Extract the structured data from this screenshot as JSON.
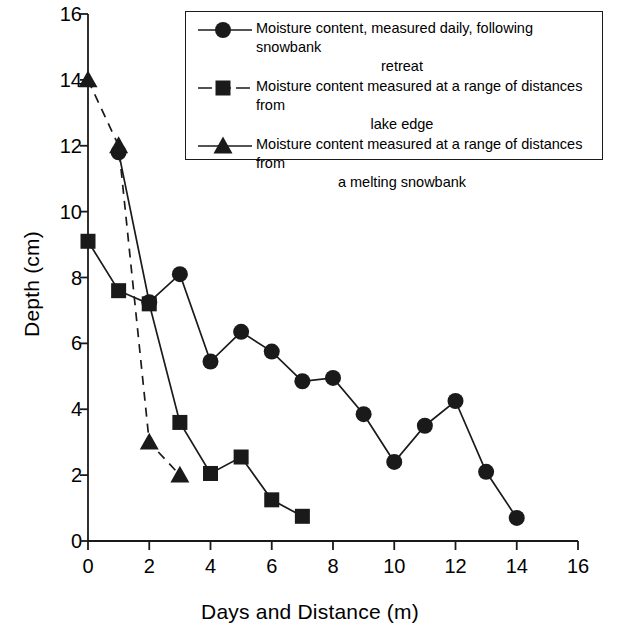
{
  "chart_data": {
    "type": "line",
    "title": "",
    "xlabel": "Days and Distance (m)",
    "ylabel": "Depth (cm)",
    "xlim": [
      0,
      16
    ],
    "ylim": [
      0,
      16
    ],
    "xticks": [
      0,
      2,
      4,
      6,
      8,
      10,
      12,
      14,
      16
    ],
    "yticks": [
      0,
      2,
      4,
      6,
      8,
      10,
      12,
      14,
      16
    ],
    "grid": false,
    "legend_position": "top-right",
    "series": [
      {
        "name": "Moisture content, measured daily, following snowbank retreat",
        "marker": "circle",
        "linestyle": "solid",
        "x": [
          1,
          2,
          3,
          4,
          5,
          6,
          7,
          8,
          9,
          10,
          11,
          12,
          13,
          14
        ],
        "y": [
          11.8,
          7.25,
          8.1,
          5.45,
          6.35,
          5.75,
          4.85,
          4.95,
          3.85,
          2.4,
          3.5,
          4.25,
          2.1,
          0.7
        ]
      },
      {
        "name": "Moisture content measured at a range of distances from lake edge",
        "marker": "square",
        "linestyle": "solid",
        "x": [
          0,
          1,
          2,
          3,
          4,
          5,
          6,
          7
        ],
        "y": [
          9.1,
          7.6,
          7.2,
          3.6,
          2.05,
          2.55,
          1.25,
          0.75
        ]
      },
      {
        "name": "Moisture content measured at a range of distances from a melting snowbank",
        "marker": "triangle",
        "linestyle": "dashed",
        "x": [
          0,
          1,
          2,
          3
        ],
        "y": [
          14.0,
          12.0,
          3.0,
          2.0
        ]
      }
    ]
  },
  "legend": {
    "items": [
      {
        "marker": "circle",
        "linestyle": "solid",
        "line1": "Moisture content, measured daily, following snowbank",
        "line2": "retreat"
      },
      {
        "marker": "square",
        "linestyle": "dashed",
        "line1": "Moisture content measured at a range of distances from",
        "line2": "lake edge"
      },
      {
        "marker": "triangle",
        "linestyle": "solid",
        "line1": "Moisture content measured at a range of distances from",
        "line2": "a melting snowbank"
      }
    ]
  },
  "colors": {
    "ink": "#1a1a1a",
    "background": "#ffffff"
  }
}
